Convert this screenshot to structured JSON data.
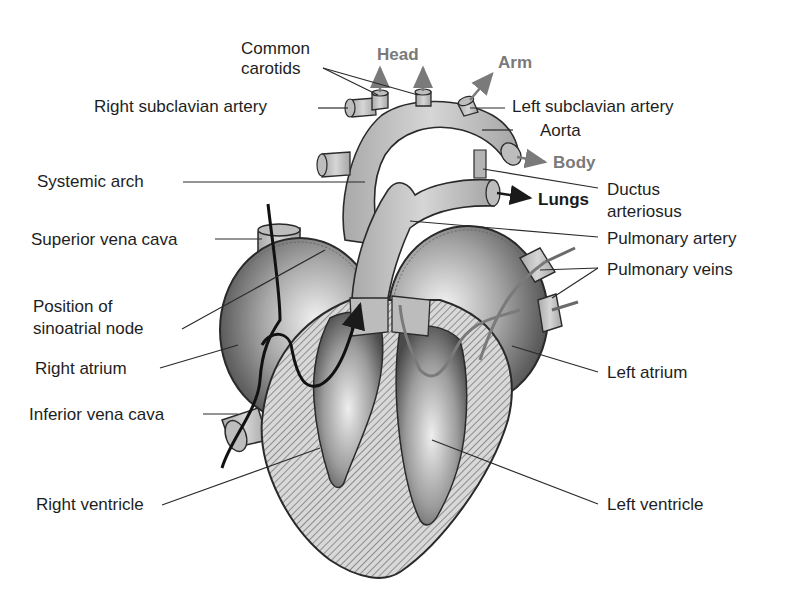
{
  "diagram": {
    "colors": {
      "text": "#1e1e1e",
      "flow_gray": "#7a7a7a",
      "flow_dark": "#1a1a1a",
      "vessel_fill": "#c4c4c4",
      "chamber_fill": "#9a9a9a",
      "hatch": "#8a8a8a",
      "outline": "#2a2a2a"
    },
    "labels": {
      "common_carotids_1": "Common",
      "common_carotids_2": "carotids",
      "right_subclavian": "Right subclavian artery",
      "systemic_arch": "Systemic arch",
      "superior_vena_cava": "Superior vena cava",
      "sa_node_1": "Position of",
      "sa_node_2": "sinoatrial node",
      "right_atrium": "Right atrium",
      "inferior_vena_cava": "Inferior vena cava",
      "right_ventricle": "Right ventricle",
      "left_subclavian": "Left subclavian artery",
      "aorta": "Aorta",
      "ductus_1": "Ductus",
      "ductus_2": "arteriosus",
      "pulmonary_artery": "Pulmonary artery",
      "pulmonary_veins": "Pulmonary veins",
      "left_atrium": "Left atrium",
      "left_ventricle": "Left ventricle"
    },
    "flow_labels": {
      "head": "Head",
      "arm": "Arm",
      "body": "Body",
      "lungs": "Lungs"
    }
  }
}
